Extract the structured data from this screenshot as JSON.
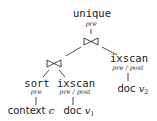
{
  "diagram": {
    "type": "query-plan-tree",
    "nodes": {
      "unique": {
        "label": "unique",
        "annotation": "pre"
      },
      "join_top": {
        "symbol": "⋈"
      },
      "join_left": {
        "symbol": "⋈"
      },
      "sort": {
        "label": "sort",
        "annotation": "pre"
      },
      "ixscan_left": {
        "label": "ixscan",
        "annotation": "pre / post"
      },
      "ixscan_right": {
        "label": "ixscan",
        "annotation": "pre / post"
      },
      "leaf_context": {
        "text": "context",
        "var": "c",
        "sub": ""
      },
      "leaf_doc1": {
        "text": "doc",
        "var": "v",
        "sub": "1"
      },
      "leaf_doc2": {
        "text": "doc",
        "var": "v",
        "sub": "2"
      }
    },
    "edges": [
      [
        "unique",
        "join_top"
      ],
      [
        "join_top",
        "join_left"
      ],
      [
        "join_top",
        "ixscan_right"
      ],
      [
        "join_left",
        "sort"
      ],
      [
        "join_left",
        "ixscan_left"
      ],
      [
        "sort",
        "leaf_context"
      ],
      [
        "ixscan_left",
        "leaf_doc1"
      ],
      [
        "ixscan_right",
        "leaf_doc2"
      ]
    ],
    "colors": {
      "ink": "#1a1a1a",
      "background": "#ffffff"
    }
  }
}
